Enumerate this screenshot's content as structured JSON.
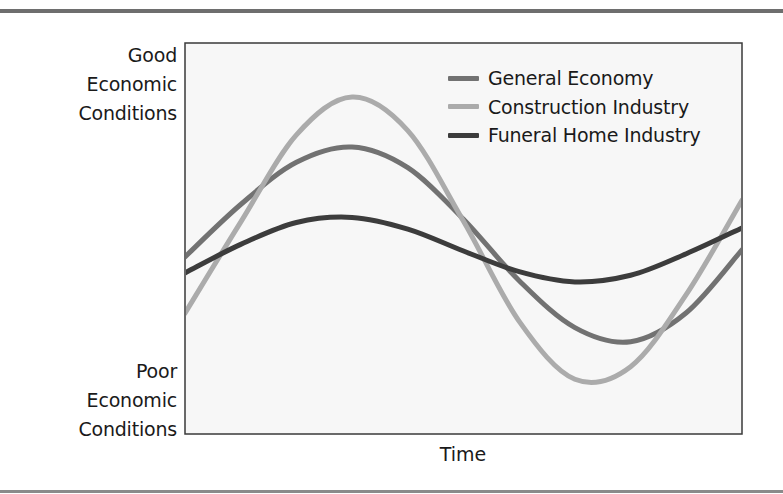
{
  "figure": {
    "y_axis_top_label": [
      "Good",
      "Economic",
      "Conditions"
    ],
    "y_axis_bottom_label": [
      "Poor",
      "Economic",
      "Conditions"
    ],
    "x_axis_label": "Time"
  },
  "legend": [
    {
      "label": "General Economy",
      "color": "#727272"
    },
    {
      "label": "Construction Industry",
      "color": "#ababab"
    },
    {
      "label": "Funeral Home Industry",
      "color": "#3c3c3c"
    }
  ],
  "chart_data": {
    "type": "line",
    "title": "",
    "xlabel": "Time",
    "ylabel": "Economic Conditions (Poor to Good)",
    "y_tick_labels": {
      "top": "Good Economic Conditions",
      "bottom": "Poor Economic Conditions"
    },
    "xlim": [
      0,
      100
    ],
    "ylim": [
      0,
      100
    ],
    "grid": false,
    "legend_position": "upper right (inside plot)",
    "x": [
      0,
      10,
      20,
      30,
      40,
      50,
      60,
      70,
      80,
      90,
      100
    ],
    "series": [
      {
        "name": "General Economy",
        "color": "#727272",
        "values": [
          45.3,
          58.7,
          69.5,
          73.4,
          68.1,
          54.9,
          39.2,
          27.2,
          23.6,
          31.0,
          47.1
        ]
      },
      {
        "name": "Construction Industry",
        "color": "#ababab",
        "values": [
          30.9,
          54.2,
          76.5,
          86.2,
          77.6,
          54.4,
          28.8,
          14.0,
          17.2,
          35.7,
          59.8
        ]
      },
      {
        "name": "Funeral Home Industry",
        "color": "#3c3c3c",
        "values": [
          41.2,
          48.5,
          54.1,
          55.4,
          52.4,
          46.8,
          41.5,
          38.9,
          40.6,
          46.1,
          52.7
        ]
      }
    ]
  }
}
